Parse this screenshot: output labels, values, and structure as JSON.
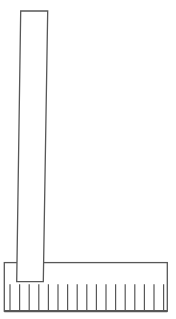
{
  "figure": {
    "canvas": {
      "width": 176,
      "height": 319,
      "background": "#ffffff"
    },
    "stroke_color": "#575757",
    "fill_color": "#ffffff",
    "vertical_bar": {
      "points": [
        [
          20.7,
          11
        ],
        [
          47.7,
          11
        ],
        [
          43.3,
          281.7
        ],
        [
          16.7,
          281.7
        ]
      ],
      "stroke_width": 1.3
    },
    "base_strip": {
      "x": 4.3,
      "y": 262.6,
      "width": 163,
      "height": 48.6,
      "stroke_width": 1.3,
      "bottom_edge_stroke_width": 2.2
    },
    "ticks": {
      "count": 17,
      "x_start": 10,
      "spacing": 9.6,
      "y_top": 284.3,
      "y_bottom": 310.6,
      "stroke_width": 1.2
    }
  }
}
